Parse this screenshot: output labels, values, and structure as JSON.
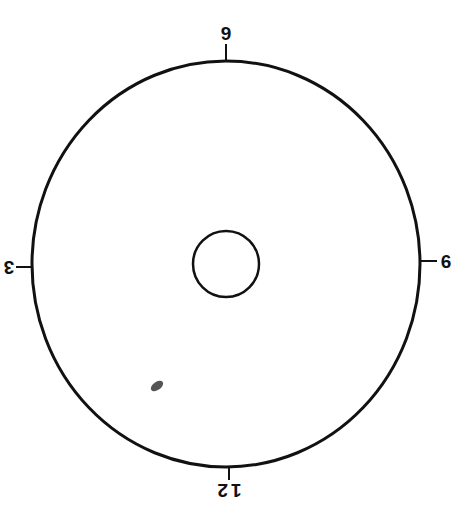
{
  "diagram": {
    "type": "clock-face-target",
    "outer_circle": {
      "cx": 226,
      "cy": 264,
      "rx": 194,
      "ry": 203,
      "stroke": "#111111",
      "stroke_width": 3
    },
    "inner_circle": {
      "cx": 226,
      "cy": 264,
      "r": 33,
      "stroke": "#111111",
      "stroke_width": 2.5
    },
    "mark": {
      "cx": 157,
      "cy": 386,
      "color": "#555555"
    },
    "ticks": [
      {
        "position": "top",
        "label": "9",
        "rotated": false
      },
      {
        "position": "bottom",
        "label": "12",
        "rotated": true
      },
      {
        "position": "left",
        "label": "3",
        "rotated": true
      },
      {
        "position": "right",
        "label": "6",
        "rotated": false
      }
    ]
  }
}
